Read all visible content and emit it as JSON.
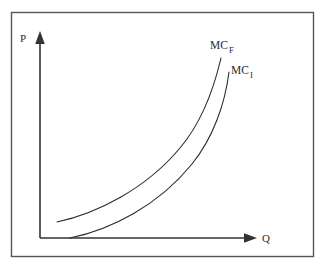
{
  "figure": {
    "background_color": "#ffffff",
    "frame": {
      "name": "outer-border",
      "stroke_color": "#555555",
      "x": 11,
      "y": 12,
      "width": 302,
      "height": 244
    },
    "axes": {
      "stroke_color": "#333333",
      "origin": {
        "x": 40,
        "y": 238
      },
      "y_axis": {
        "label": "P",
        "label_x": 20,
        "label_y": 42,
        "top_y": 33,
        "arrow": "up-arrowhead"
      },
      "x_axis": {
        "label": "Q",
        "label_x": 262,
        "label_y": 242,
        "right_x": 255,
        "arrow": "right-arrowhead"
      }
    },
    "curves": [
      {
        "id": "mc-f",
        "label_main": "MC",
        "label_sub": "F",
        "label_x": 210,
        "label_y": 49,
        "label_sub_x": 229,
        "label_sub_y": 53,
        "stroke_color": "#2b2b2b",
        "stroke_width": 1.1,
        "path": "M 57,222 C 95,214 145,190 180,148 C 202,122 214,88 221,58",
        "description": "upper marginal cost curve, shifted left and up"
      },
      {
        "id": "mc-i",
        "label_main": "MC",
        "label_sub": "I",
        "label_x": 231,
        "label_y": 74,
        "label_sub_x": 250,
        "label_sub_y": 78,
        "stroke_color": "#2b2b2b",
        "stroke_width": 1.1,
        "path": "M 70,238 C 110,230 158,206 192,164 C 213,138 225,104 229,72",
        "description": "lower marginal cost curve, shifted right and down"
      }
    ]
  },
  "chart_data": {
    "type": "line",
    "title": "",
    "xlabel": "Q",
    "ylabel": "P",
    "grid": false,
    "legend": "inline-curve-labels",
    "axis_style": "arrowed-quadrant",
    "series": [
      {
        "name": "MC_F",
        "display_main": "MC",
        "display_sub": "F",
        "points": [
          [
            0.1,
            0.12
          ],
          [
            0.25,
            0.17
          ],
          [
            0.4,
            0.26
          ],
          [
            0.55,
            0.4
          ],
          [
            0.7,
            0.58
          ],
          [
            0.84,
            0.8
          ]
        ],
        "note": "Marginal cost curve for the foreign firm; lies above and to the left of MC_I"
      },
      {
        "name": "MC_I",
        "display_main": "MC",
        "display_sub": "I",
        "points": [
          [
            0.16,
            0.04
          ],
          [
            0.31,
            0.09
          ],
          [
            0.46,
            0.18
          ],
          [
            0.61,
            0.32
          ],
          [
            0.76,
            0.5
          ],
          [
            0.88,
            0.72
          ]
        ],
        "note": "Marginal cost curve for the incumbent/domestic firm; lies below and to the right of MC_F"
      }
    ],
    "xlim": [
      0,
      1
    ],
    "ylim": [
      0,
      1
    ]
  }
}
